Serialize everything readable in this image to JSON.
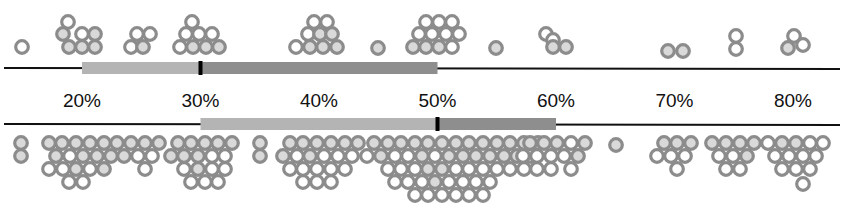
{
  "chart_data": {
    "type": "scatter",
    "subtype": "beeswarm-dot-plot with range bars",
    "title": "",
    "xlabel": "",
    "ylabel": "",
    "x_ticks": [
      "20%",
      "30%",
      "40%",
      "50%",
      "60%",
      "70%",
      "80%"
    ],
    "x_tick_values": [
      20,
      30,
      40,
      50,
      60,
      70,
      80
    ],
    "xlim": [
      13,
      84
    ],
    "grid": false,
    "legend": "none",
    "colors": {
      "dot_stroke": "#8c8c8c",
      "dot_fill_light": "#d9d9d9",
      "dot_fill_white": "#ffffff",
      "bar_light": "#b4b4b4",
      "bar_dark": "#8e8e8e",
      "axis_line": "#111111",
      "median_tick": "#000000"
    },
    "series": [
      {
        "name": "upper",
        "position": "above-axis",
        "range_bar": {
          "start": 20,
          "median": 30,
          "end": 50
        },
        "clusters": [
          {
            "center_pct": 14.5,
            "count": 1
          },
          {
            "center_pct": 19.5,
            "count": 7
          },
          {
            "center_pct": 24.5,
            "count": 4
          },
          {
            "center_pct": 29.5,
            "count": 8
          },
          {
            "center_pct": 39.5,
            "count": 9
          },
          {
            "center_pct": 44.5,
            "count": 1
          },
          {
            "center_pct": 49.5,
            "count": 12
          },
          {
            "center_pct": 54.5,
            "count": 1
          },
          {
            "center_pct": 59.5,
            "count": 3
          },
          {
            "center_pct": 69.5,
            "count": 2
          },
          {
            "center_pct": 74.5,
            "count": 2
          },
          {
            "center_pct": 79.5,
            "count": 2
          }
        ]
      },
      {
        "name": "lower",
        "position": "below-axis",
        "range_bar": {
          "start": 30,
          "median": 50,
          "end": 60
        },
        "clusters": [
          {
            "center_pct": 14.5,
            "count": 2
          },
          {
            "center_pct": 24.5,
            "count": 29
          },
          {
            "center_pct": 29.5,
            "count": 18
          },
          {
            "center_pct": 34.5,
            "count": 2
          },
          {
            "center_pct": 39.5,
            "count": 27
          },
          {
            "center_pct": 49.5,
            "count": 48
          },
          {
            "center_pct": 59.5,
            "count": 13
          },
          {
            "center_pct": 64.5,
            "count": 1
          },
          {
            "center_pct": 69.5,
            "count": 8
          },
          {
            "center_pct": 74.5,
            "count": 10
          },
          {
            "center_pct": 79.5,
            "count": 14
          }
        ]
      }
    ]
  },
  "layout": {
    "px_per_pct": 11.85,
    "x_at_20": 82,
    "upper_axis_y": 68,
    "lower_axis_y": 124,
    "tick_label_y": 107,
    "dot_r": 6.3,
    "dot_stroke": 3.2
  },
  "dots": {
    "upper": [
      [
        22,
        47,
        "w"
      ],
      [
        68,
        22,
        "w"
      ],
      [
        63,
        34,
        "l"
      ],
      [
        82,
        34,
        "w"
      ],
      [
        95,
        34,
        "l"
      ],
      [
        69,
        47,
        "l"
      ],
      [
        82,
        47,
        "l"
      ],
      [
        95,
        47,
        "l"
      ],
      [
        137,
        34,
        "w"
      ],
      [
        150,
        34,
        "w"
      ],
      [
        131,
        47,
        "w"
      ],
      [
        143,
        47,
        "l"
      ],
      [
        192,
        22,
        "w"
      ],
      [
        186,
        34,
        "w"
      ],
      [
        199,
        34,
        "w"
      ],
      [
        212,
        34,
        "w"
      ],
      [
        180,
        47,
        "w"
      ],
      [
        193,
        47,
        "l"
      ],
      [
        206,
        47,
        "l"
      ],
      [
        219,
        47,
        "l"
      ],
      [
        314,
        22,
        "w"
      ],
      [
        327,
        22,
        "w"
      ],
      [
        308,
        34,
        "w"
      ],
      [
        320,
        34,
        "l"
      ],
      [
        332,
        34,
        "l"
      ],
      [
        296,
        47,
        "w"
      ],
      [
        310,
        47,
        "l"
      ],
      [
        323,
        47,
        "l"
      ],
      [
        337,
        47,
        "l"
      ],
      [
        378,
        48,
        "l"
      ],
      [
        426,
        22,
        "w"
      ],
      [
        439,
        22,
        "w"
      ],
      [
        452,
        22,
        "w"
      ],
      [
        419,
        34,
        "w"
      ],
      [
        432,
        34,
        "w"
      ],
      [
        446,
        34,
        "w"
      ],
      [
        459,
        34,
        "w"
      ],
      [
        413,
        47,
        "l"
      ],
      [
        426,
        47,
        "l"
      ],
      [
        439,
        47,
        "l"
      ],
      [
        452,
        47,
        "w"
      ],
      [
        496,
        48,
        "l"
      ],
      [
        546,
        34,
        "w"
      ],
      [
        553,
        40,
        "w"
      ],
      [
        553,
        47,
        "l"
      ],
      [
        566,
        47,
        "l"
      ],
      [
        668,
        51,
        "l"
      ],
      [
        683,
        51,
        "l"
      ],
      [
        736,
        36,
        "w"
      ],
      [
        736,
        49,
        "w"
      ],
      [
        794,
        36,
        "w"
      ],
      [
        788,
        48,
        "l"
      ],
      [
        803,
        45,
        "w"
      ]
    ],
    "lower": [
      [
        21,
        143,
        "l"
      ],
      [
        21,
        156,
        "l"
      ],
      [
        49,
        143,
        "l"
      ],
      [
        62,
        143,
        "l"
      ],
      [
        76,
        143,
        "l"
      ],
      [
        90,
        143,
        "l"
      ],
      [
        104,
        143,
        "l"
      ],
      [
        117,
        143,
        "l"
      ],
      [
        131,
        143,
        "l"
      ],
      [
        145,
        143,
        "l"
      ],
      [
        159,
        143,
        "l"
      ],
      [
        56,
        156,
        "l"
      ],
      [
        70,
        156,
        "w"
      ],
      [
        83,
        156,
        "l"
      ],
      [
        97,
        156,
        "l"
      ],
      [
        111,
        156,
        "l"
      ],
      [
        124,
        156,
        "l"
      ],
      [
        138,
        156,
        "w"
      ],
      [
        152,
        156,
        "w"
      ],
      [
        49,
        169,
        "w"
      ],
      [
        63,
        169,
        "w"
      ],
      [
        76,
        169,
        "l"
      ],
      [
        90,
        169,
        "w"
      ],
      [
        104,
        169,
        "l"
      ],
      [
        145,
        169,
        "w"
      ],
      [
        69,
        182,
        "w"
      ],
      [
        83,
        182,
        "w"
      ],
      [
        178,
        143,
        "l"
      ],
      [
        191,
        143,
        "l"
      ],
      [
        205,
        143,
        "l"
      ],
      [
        218,
        143,
        "l"
      ],
      [
        232,
        143,
        "l"
      ],
      [
        171,
        156,
        "l"
      ],
      [
        184,
        156,
        "l"
      ],
      [
        198,
        156,
        "l"
      ],
      [
        212,
        156,
        "w"
      ],
      [
        225,
        156,
        "w"
      ],
      [
        184,
        169,
        "w"
      ],
      [
        198,
        169,
        "l"
      ],
      [
        212,
        169,
        "w"
      ],
      [
        225,
        169,
        "w"
      ],
      [
        191,
        182,
        "w"
      ],
      [
        205,
        182,
        "w"
      ],
      [
        218,
        182,
        "w"
      ],
      [
        260,
        143,
        "l"
      ],
      [
        260,
        156,
        "l"
      ],
      [
        290,
        143,
        "l"
      ],
      [
        303,
        143,
        "l"
      ],
      [
        317,
        143,
        "l"
      ],
      [
        331,
        143,
        "l"
      ],
      [
        345,
        143,
        "l"
      ],
      [
        358,
        143,
        "l"
      ],
      [
        374,
        143,
        "l"
      ],
      [
        388,
        143,
        "l"
      ],
      [
        401,
        143,
        "l"
      ],
      [
        283,
        156,
        "l"
      ],
      [
        297,
        156,
        "w"
      ],
      [
        310,
        156,
        "l"
      ],
      [
        324,
        156,
        "w"
      ],
      [
        338,
        156,
        "w"
      ],
      [
        352,
        156,
        "w"
      ],
      [
        367,
        156,
        "w"
      ],
      [
        381,
        156,
        "l"
      ],
      [
        395,
        156,
        "w"
      ],
      [
        290,
        169,
        "w"
      ],
      [
        303,
        169,
        "w"
      ],
      [
        317,
        169,
        "w"
      ],
      [
        331,
        169,
        "w"
      ],
      [
        345,
        169,
        "w"
      ],
      [
        388,
        169,
        "w"
      ],
      [
        303,
        182,
        "w"
      ],
      [
        317,
        182,
        "w"
      ],
      [
        331,
        182,
        "w"
      ],
      [
        415,
        143,
        "l"
      ],
      [
        428,
        143,
        "l"
      ],
      [
        442,
        143,
        "l"
      ],
      [
        456,
        143,
        "l"
      ],
      [
        469,
        143,
        "l"
      ],
      [
        483,
        143,
        "l"
      ],
      [
        497,
        143,
        "l"
      ],
      [
        510,
        143,
        "l"
      ],
      [
        524,
        143,
        "l"
      ],
      [
        538,
        143,
        "l"
      ],
      [
        408,
        156,
        "w"
      ],
      [
        422,
        156,
        "l"
      ],
      [
        435,
        156,
        "w"
      ],
      [
        449,
        156,
        "l"
      ],
      [
        463,
        156,
        "l"
      ],
      [
        476,
        156,
        "l"
      ],
      [
        490,
        156,
        "l"
      ],
      [
        504,
        156,
        "l"
      ],
      [
        517,
        156,
        "l"
      ],
      [
        531,
        156,
        "w"
      ],
      [
        401,
        169,
        "w"
      ],
      [
        415,
        169,
        "w"
      ],
      [
        428,
        169,
        "l"
      ],
      [
        442,
        169,
        "l"
      ],
      [
        456,
        169,
        "w"
      ],
      [
        469,
        169,
        "w"
      ],
      [
        483,
        169,
        "w"
      ],
      [
        497,
        169,
        "w"
      ],
      [
        510,
        169,
        "w"
      ],
      [
        524,
        169,
        "w"
      ],
      [
        395,
        182,
        "w"
      ],
      [
        408,
        182,
        "w"
      ],
      [
        422,
        182,
        "w"
      ],
      [
        435,
        182,
        "l"
      ],
      [
        449,
        182,
        "w"
      ],
      [
        463,
        182,
        "w"
      ],
      [
        476,
        182,
        "w"
      ],
      [
        490,
        182,
        "w"
      ],
      [
        415,
        195,
        "w"
      ],
      [
        428,
        195,
        "w"
      ],
      [
        442,
        195,
        "w"
      ],
      [
        456,
        195,
        "w"
      ],
      [
        469,
        195,
        "w"
      ],
      [
        483,
        195,
        "w"
      ],
      [
        530,
        143,
        "l"
      ],
      [
        544,
        143,
        "l"
      ],
      [
        557,
        143,
        "l"
      ],
      [
        571,
        143,
        "w"
      ],
      [
        585,
        143,
        "l"
      ],
      [
        523,
        156,
        "w"
      ],
      [
        537,
        156,
        "w"
      ],
      [
        551,
        156,
        "w"
      ],
      [
        564,
        156,
        "w"
      ],
      [
        578,
        156,
        "l"
      ],
      [
        537,
        169,
        "w"
      ],
      [
        551,
        169,
        "w"
      ],
      [
        571,
        169,
        "w"
      ],
      [
        616,
        145,
        "l"
      ],
      [
        664,
        143,
        "l"
      ],
      [
        677,
        143,
        "l"
      ],
      [
        691,
        143,
        "l"
      ],
      [
        657,
        156,
        "w"
      ],
      [
        671,
        156,
        "w"
      ],
      [
        685,
        156,
        "w"
      ],
      [
        677,
        169,
        "w"
      ],
      [
        712,
        143,
        "l"
      ],
      [
        726,
        143,
        "l"
      ],
      [
        740,
        143,
        "l"
      ],
      [
        754,
        143,
        "l"
      ],
      [
        719,
        156,
        "w"
      ],
      [
        733,
        156,
        "w"
      ],
      [
        747,
        156,
        "l"
      ],
      [
        726,
        169,
        "w"
      ],
      [
        740,
        169,
        "w"
      ],
      [
        768,
        143,
        "w"
      ],
      [
        782,
        143,
        "l"
      ],
      [
        796,
        143,
        "l"
      ],
      [
        810,
        143,
        "w"
      ],
      [
        823,
        143,
        "w"
      ],
      [
        775,
        156,
        "w"
      ],
      [
        789,
        156,
        "w"
      ],
      [
        803,
        156,
        "w"
      ],
      [
        816,
        156,
        "w"
      ],
      [
        782,
        169,
        "w"
      ],
      [
        796,
        169,
        "w"
      ],
      [
        810,
        169,
        "w"
      ],
      [
        803,
        184,
        "w"
      ]
    ]
  }
}
